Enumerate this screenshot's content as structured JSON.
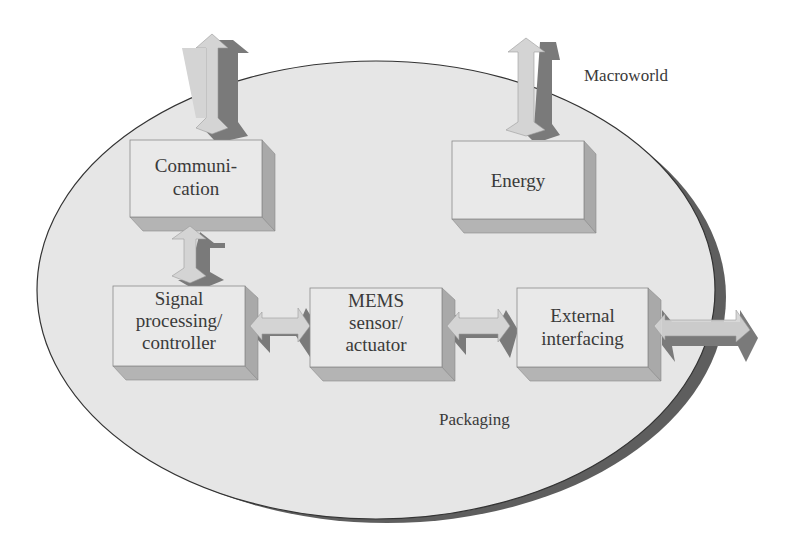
{
  "diagram": {
    "regions": {
      "macroworld": "Macroworld",
      "packaging": "Packaging"
    },
    "blocks": [
      {
        "id": "communication",
        "lines": [
          "Communi-",
          "cation"
        ]
      },
      {
        "id": "energy",
        "lines": [
          "Energy"
        ]
      },
      {
        "id": "signal",
        "lines": [
          "Signal",
          "processing/",
          "controller"
        ]
      },
      {
        "id": "mems",
        "lines": [
          "MEMS",
          "sensor/",
          "actuator"
        ]
      },
      {
        "id": "external",
        "lines": [
          "External",
          "interfacing"
        ]
      }
    ],
    "connections": [
      {
        "from": "macroworld",
        "to": "communication",
        "type": "bidirectional"
      },
      {
        "from": "macroworld",
        "to": "energy",
        "type": "bidirectional"
      },
      {
        "from": "communication",
        "to": "signal",
        "type": "bidirectional"
      },
      {
        "from": "signal",
        "to": "mems",
        "type": "bidirectional"
      },
      {
        "from": "mems",
        "to": "external",
        "type": "bidirectional"
      },
      {
        "from": "external",
        "to": "macroworld",
        "type": "bidirectional"
      }
    ],
    "colors": {
      "ellipse_fill": "#e6e6e6",
      "ellipse_shadow": "#5e5e5e",
      "box_front": "#e9e9e9",
      "box_side": "#a9a9a9",
      "box_bottom": "#b4b4b4",
      "arrow_light": "#d4d4d4",
      "arrow_dark": "#7a7a7a",
      "text": "#3a3a3a"
    }
  }
}
